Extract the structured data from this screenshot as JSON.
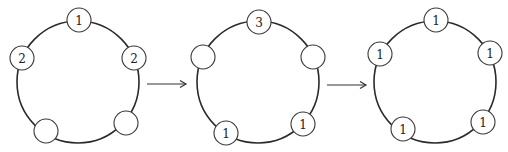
{
  "diagrams": [
    {
      "name": "state-1",
      "ring": {
        "cx": 78,
        "cy": 82,
        "r": 61
      },
      "nodes": [
        {
          "position": "top",
          "cx": 79,
          "cy": 20,
          "label": "1"
        },
        {
          "position": "left",
          "cx": 22,
          "cy": 58,
          "label": "2"
        },
        {
          "position": "right",
          "cx": 134,
          "cy": 58,
          "label": "2"
        },
        {
          "position": "bottom-left",
          "cx": 46,
          "cy": 131,
          "label": ""
        },
        {
          "position": "bottom-right",
          "cx": 126,
          "cy": 123,
          "label": ""
        }
      ]
    },
    {
      "name": "state-2",
      "ring": {
        "cx": 258,
        "cy": 82,
        "r": 61
      },
      "nodes": [
        {
          "position": "top",
          "cx": 259,
          "cy": 22,
          "label": "3"
        },
        {
          "position": "left",
          "cx": 203,
          "cy": 57,
          "label": ""
        },
        {
          "position": "right",
          "cx": 313,
          "cy": 57,
          "label": ""
        },
        {
          "position": "bottom-left",
          "cx": 226,
          "cy": 133,
          "label": "1"
        },
        {
          "position": "bottom-right",
          "cx": 303,
          "cy": 124,
          "label": "1"
        }
      ]
    },
    {
      "name": "state-3",
      "ring": {
        "cx": 435,
        "cy": 82,
        "r": 61
      },
      "nodes": [
        {
          "position": "top",
          "cx": 436,
          "cy": 20,
          "label": "1"
        },
        {
          "position": "left",
          "cx": 380,
          "cy": 54,
          "label": "1"
        },
        {
          "position": "right",
          "cx": 490,
          "cy": 53,
          "label": "1"
        },
        {
          "position": "bottom-left",
          "cx": 403,
          "cy": 129,
          "label": "1"
        },
        {
          "position": "bottom-right",
          "cx": 483,
          "cy": 122,
          "label": "1"
        }
      ]
    }
  ],
  "arrows": [
    {
      "name": "arrow-1-to-2",
      "x1": 147,
      "x2": 186,
      "y": 84
    },
    {
      "name": "arrow-2-to-3",
      "x1": 327,
      "x2": 366,
      "y": 85
    }
  ],
  "node_radius": 12
}
